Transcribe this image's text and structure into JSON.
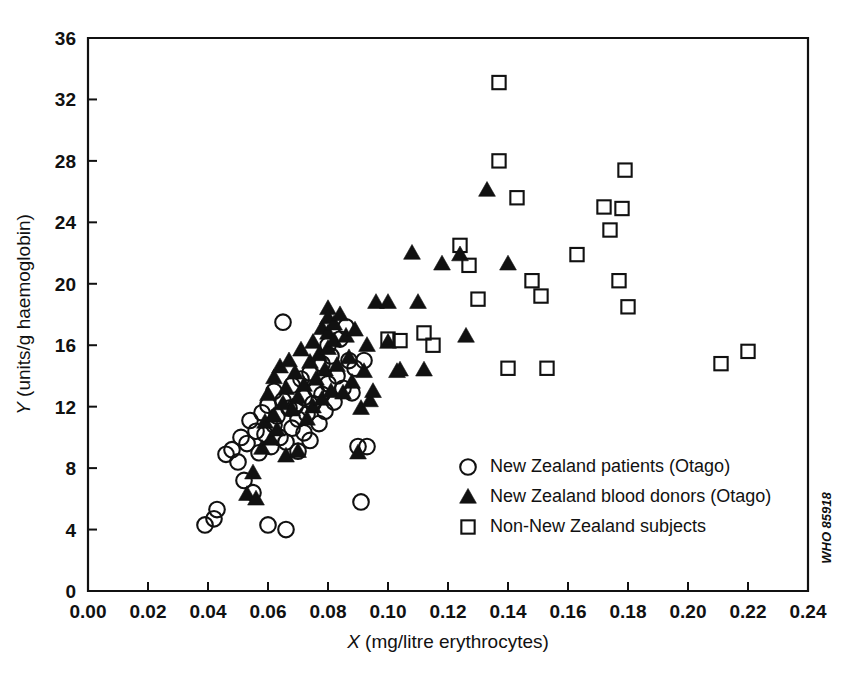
{
  "figure": {
    "code_label": "WHO 85918",
    "background": "#ffffff",
    "ink": "#111111"
  },
  "chart_data": {
    "type": "scatter",
    "title": "",
    "xlabel": "X (mg/litre erythrocytes)",
    "xlabel_italic_part": "X",
    "xlabel_rest": " (mg/litre erythrocytes)",
    "ylabel": "Y (units/g haemoglobin)",
    "ylabel_italic_part": "Y",
    "ylabel_rest": " (units/g haemoglobin)",
    "xlim": [
      0.0,
      0.24
    ],
    "ylim": [
      0,
      36
    ],
    "xticks": [
      0.0,
      0.02,
      0.04,
      0.06,
      0.08,
      0.1,
      0.12,
      0.14,
      0.16,
      0.18,
      0.2,
      0.22,
      0.24
    ],
    "xticklabels": [
      "0.00",
      "0.02",
      "0.04",
      "0.06",
      "0.08",
      "0.10",
      "0.12",
      "0.14",
      "0.16",
      "0.18",
      "0.20",
      "0.22",
      "0.24"
    ],
    "yticks": [
      0,
      4,
      8,
      12,
      16,
      20,
      24,
      28,
      32,
      36
    ],
    "yticklabels": [
      "0",
      "4",
      "8",
      "12",
      "16",
      "20",
      "24",
      "28",
      "32",
      "36"
    ],
    "grid": false,
    "legend_position": "lower-right-inside",
    "series": [
      {
        "name": "New Zealand patients (Otago)",
        "marker": "circle",
        "filled": false,
        "points": [
          [
            0.039,
            4.3
          ],
          [
            0.042,
            4.7
          ],
          [
            0.043,
            5.3
          ],
          [
            0.046,
            8.9
          ],
          [
            0.048,
            9.2
          ],
          [
            0.05,
            8.4
          ],
          [
            0.051,
            10.0
          ],
          [
            0.052,
            7.2
          ],
          [
            0.053,
            9.6
          ],
          [
            0.054,
            11.1
          ],
          [
            0.055,
            6.4
          ],
          [
            0.056,
            10.4
          ],
          [
            0.057,
            9.0
          ],
          [
            0.058,
            11.6
          ],
          [
            0.059,
            10.2
          ],
          [
            0.06,
            4.3
          ],
          [
            0.06,
            12.1
          ],
          [
            0.061,
            9.4
          ],
          [
            0.062,
            10.8
          ],
          [
            0.062,
            13.0
          ],
          [
            0.063,
            11.4
          ],
          [
            0.064,
            10.0
          ],
          [
            0.065,
            17.5
          ],
          [
            0.065,
            12.4
          ],
          [
            0.066,
            4.0
          ],
          [
            0.066,
            9.7
          ],
          [
            0.067,
            11.9
          ],
          [
            0.068,
            10.6
          ],
          [
            0.068,
            13.4
          ],
          [
            0.069,
            12.0
          ],
          [
            0.07,
            9.1
          ],
          [
            0.07,
            11.2
          ],
          [
            0.071,
            13.8
          ],
          [
            0.072,
            10.3
          ],
          [
            0.072,
            12.6
          ],
          [
            0.073,
            11.5
          ],
          [
            0.074,
            14.2
          ],
          [
            0.074,
            9.8
          ],
          [
            0.075,
            12.2
          ],
          [
            0.076,
            13.1
          ],
          [
            0.077,
            10.9
          ],
          [
            0.078,
            14.8
          ],
          [
            0.078,
            12.8
          ],
          [
            0.079,
            11.7
          ],
          [
            0.08,
            16.0
          ],
          [
            0.08,
            13.5
          ],
          [
            0.081,
            15.3
          ],
          [
            0.082,
            12.3
          ],
          [
            0.083,
            14.0
          ],
          [
            0.084,
            16.4
          ],
          [
            0.085,
            13.2
          ],
          [
            0.086,
            17.2
          ],
          [
            0.087,
            15.0
          ],
          [
            0.088,
            12.9
          ],
          [
            0.089,
            14.5
          ],
          [
            0.09,
            9.4
          ],
          [
            0.091,
            5.8
          ],
          [
            0.092,
            15.0
          ],
          [
            0.093,
            9.4
          ]
        ]
      },
      {
        "name": "New Zealand blood donors (Otago)",
        "marker": "triangle",
        "filled": true,
        "points": [
          [
            0.053,
            6.3
          ],
          [
            0.055,
            7.7
          ],
          [
            0.056,
            6.0
          ],
          [
            0.058,
            9.3
          ],
          [
            0.059,
            11.0
          ],
          [
            0.06,
            12.8
          ],
          [
            0.061,
            9.9
          ],
          [
            0.062,
            13.9
          ],
          [
            0.062,
            11.4
          ],
          [
            0.063,
            10.5
          ],
          [
            0.064,
            14.6
          ],
          [
            0.065,
            12.2
          ],
          [
            0.066,
            8.8
          ],
          [
            0.066,
            13.2
          ],
          [
            0.067,
            15.0
          ],
          [
            0.068,
            11.8
          ],
          [
            0.069,
            14.2
          ],
          [
            0.07,
            9.1
          ],
          [
            0.07,
            12.6
          ],
          [
            0.071,
            15.7
          ],
          [
            0.072,
            13.4
          ],
          [
            0.073,
            11.2
          ],
          [
            0.074,
            14.9
          ],
          [
            0.075,
            16.2
          ],
          [
            0.075,
            12.0
          ],
          [
            0.076,
            13.8
          ],
          [
            0.077,
            15.4
          ],
          [
            0.078,
            17.1
          ],
          [
            0.078,
            12.5
          ],
          [
            0.079,
            14.4
          ],
          [
            0.08,
            18.4
          ],
          [
            0.08,
            17.8
          ],
          [
            0.08,
            16.8
          ],
          [
            0.08,
            15.8
          ],
          [
            0.081,
            13.0
          ],
          [
            0.082,
            17.4
          ],
          [
            0.082,
            16.3
          ],
          [
            0.083,
            14.7
          ],
          [
            0.084,
            18.0
          ],
          [
            0.085,
            12.9
          ],
          [
            0.086,
            16.6
          ],
          [
            0.087,
            15.2
          ],
          [
            0.088,
            13.6
          ],
          [
            0.089,
            17.0
          ],
          [
            0.09,
            9.0
          ],
          [
            0.091,
            11.9
          ],
          [
            0.092,
            14.3
          ],
          [
            0.093,
            16.0
          ],
          [
            0.094,
            12.4
          ],
          [
            0.095,
            13.0
          ],
          [
            0.096,
            18.8
          ],
          [
            0.1,
            18.8
          ],
          [
            0.1,
            16.2
          ],
          [
            0.103,
            14.3
          ],
          [
            0.104,
            14.4
          ],
          [
            0.108,
            22.0
          ],
          [
            0.11,
            18.8
          ],
          [
            0.112,
            14.4
          ],
          [
            0.118,
            21.3
          ],
          [
            0.124,
            21.9
          ],
          [
            0.126,
            16.6
          ],
          [
            0.133,
            26.1
          ],
          [
            0.14,
            21.3
          ]
        ]
      },
      {
        "name": "Non-New Zealand subjects",
        "marker": "square",
        "filled": false,
        "points": [
          [
            0.1,
            16.4
          ],
          [
            0.104,
            16.3
          ],
          [
            0.112,
            16.8
          ],
          [
            0.115,
            16.0
          ],
          [
            0.124,
            22.5
          ],
          [
            0.127,
            21.2
          ],
          [
            0.13,
            19.0
          ],
          [
            0.137,
            33.1
          ],
          [
            0.137,
            28.0
          ],
          [
            0.14,
            14.5
          ],
          [
            0.143,
            25.6
          ],
          [
            0.148,
            20.2
          ],
          [
            0.151,
            19.2
          ],
          [
            0.153,
            14.5
          ],
          [
            0.163,
            21.9
          ],
          [
            0.172,
            25.0
          ],
          [
            0.174,
            23.5
          ],
          [
            0.177,
            20.2
          ],
          [
            0.178,
            24.9
          ],
          [
            0.179,
            27.4
          ],
          [
            0.18,
            18.5
          ],
          [
            0.211,
            14.8
          ],
          [
            0.22,
            15.6
          ]
        ]
      }
    ]
  },
  "legend": {
    "entries": [
      {
        "label": "New Zealand patients (Otago)",
        "marker": "circle"
      },
      {
        "label": "New Zealand blood donors (Otago)",
        "marker": "triangle"
      },
      {
        "label": "Non-New Zealand subjects",
        "marker": "square"
      }
    ]
  }
}
